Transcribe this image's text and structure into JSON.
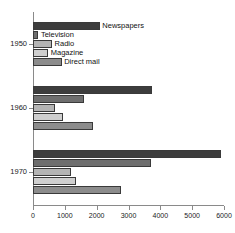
{
  "chart_data": {
    "type": "bar",
    "orientation": "horizontal",
    "title": "",
    "xlabel": "",
    "ylabel": "",
    "xlim": [
      0,
      6000
    ],
    "ylim_categories": [
      "1950",
      "1960",
      "1970"
    ],
    "grid": false,
    "legend_position": "inline-labels-on-bars",
    "xticks": [
      0,
      1000,
      2000,
      3000,
      4000,
      5000,
      6000
    ],
    "xtick_labels": [
      "0",
      "1000",
      "2000",
      "3000",
      "4000",
      "5000",
      "6000"
    ],
    "categories": [
      "1950",
      "1960",
      "1970"
    ],
    "series": [
      {
        "name": "Newspapers",
        "color": "#3d3d3d",
        "values": [
          2100,
          3750,
          5900
        ]
      },
      {
        "name": "Television",
        "color": "#6e6e6e",
        "values": [
          170,
          1600,
          3700
        ]
      },
      {
        "name": "Radio",
        "color": "#b4b4b4",
        "values": [
          600,
          700,
          1200
        ]
      },
      {
        "name": "Magazine",
        "color": "#cfcfcf",
        "values": [
          480,
          950,
          1350
        ]
      },
      {
        "name": "Direct mail",
        "color": "#8c8c8c",
        "values": [
          900,
          1900,
          2750
        ]
      }
    ],
    "inline_labels": [
      {
        "text": "Newspapers",
        "series": "Newspapers",
        "category": "1950"
      },
      {
        "text": "Television",
        "series": "Television",
        "category": "1950"
      },
      {
        "text": "Radio",
        "series": "Radio",
        "category": "1950"
      },
      {
        "text": "Magazine",
        "series": "Magazine",
        "category": "1950"
      },
      {
        "text": "Direct mail",
        "series": "Direct mail",
        "category": "1950"
      }
    ]
  },
  "axis": {
    "x_tick_labels": [
      "0",
      "1000",
      "2000",
      "3000",
      "4000",
      "5000",
      "6000"
    ],
    "y_tick_labels": [
      "1950",
      "1960",
      "1970"
    ]
  },
  "labels": {
    "newspapers": "Newspapers",
    "television": "Television",
    "radio": "Radio",
    "magazine": "Magazine",
    "direct_mail": "Direct mail"
  }
}
